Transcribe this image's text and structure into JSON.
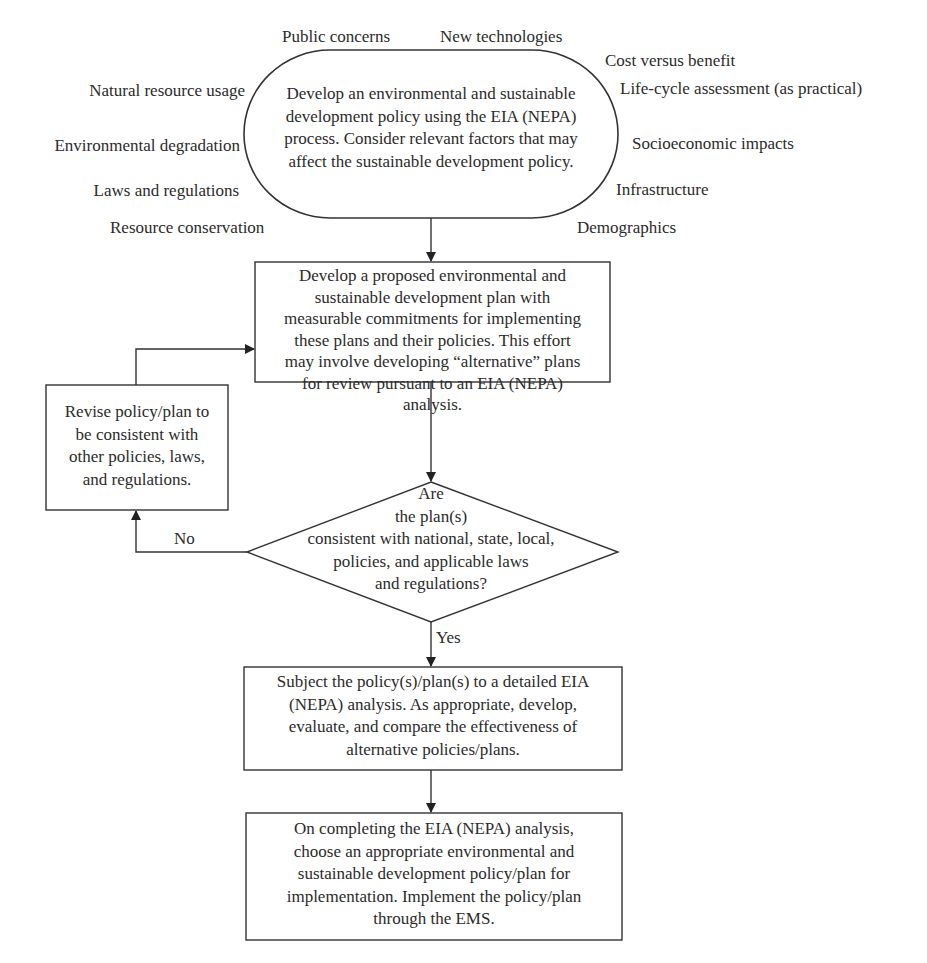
{
  "diagram": {
    "start_oval": {
      "lines": [
        "Develop an environmental and sustainable",
        "development policy using the EIA (NEPA)",
        "process. Consider relevant factors that may",
        "affect the sustainable development policy."
      ]
    },
    "factors_left": [
      "Natural resource usage",
      "Environmental degradation",
      "Laws and regulations",
      "Resource conservation"
    ],
    "factors_top": [
      "Public concerns",
      "New technologies"
    ],
    "factors_right": [
      "Cost versus benefit",
      "Life-cycle assessment (as practical)",
      "Socioeconomic impacts",
      "Infrastructure",
      "Demographics"
    ],
    "plan_box": {
      "lines": [
        "Develop a proposed environmental and",
        "sustainable development plan with",
        "measurable commitments for implementing",
        "these plans and their policies. This effort",
        "may involve developing “alternative” plans",
        "for review pursuant to an EIA (NEPA)",
        "analysis."
      ]
    },
    "revise_box": {
      "lines": [
        "Revise policy/plan to",
        "be consistent with",
        "other policies, laws,",
        "and regulations."
      ]
    },
    "decision": {
      "lines": [
        "Are",
        "the plan(s)",
        "consistent with national, state, local,",
        "policies, and applicable laws",
        "and regulations?"
      ],
      "no_label": "No",
      "yes_label": "Yes"
    },
    "analysis_box": {
      "lines": [
        "Subject the policy(s)/plan(s) to a detailed EIA",
        "(NEPA) analysis. As appropriate, develop,",
        "evaluate, and compare the effectiveness of",
        "alternative policies/plans."
      ]
    },
    "implement_box": {
      "lines": [
        "On completing the EIA (NEPA) analysis,",
        "choose an appropriate environmental and",
        "sustainable development policy/plan for",
        "implementation. Implement the policy/plan",
        "through the EMS."
      ]
    }
  }
}
